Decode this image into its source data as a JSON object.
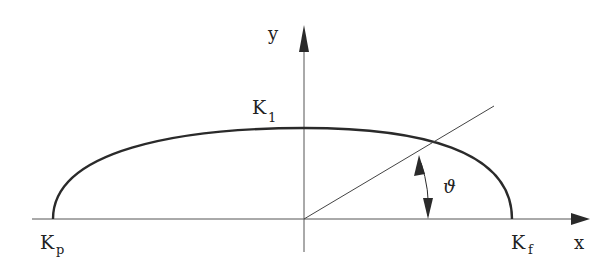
{
  "diagram": {
    "type": "ellipse-polar-angle",
    "colors": {
      "stroke": "#2a2a2a",
      "background": "#ffffff"
    },
    "axes": {
      "x_label": "x",
      "y_label": "y"
    },
    "points": {
      "left": {
        "main": "K",
        "sub": "p"
      },
      "top": {
        "main": "K",
        "sub": "1"
      },
      "right": {
        "main": "K",
        "sub": "f"
      }
    },
    "angle_label": "ϑ"
  }
}
